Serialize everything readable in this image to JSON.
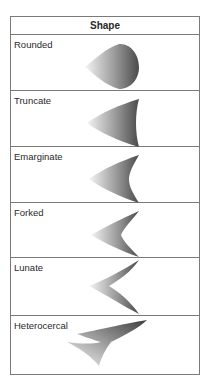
{
  "table": {
    "header": "Shape",
    "rows": [
      {
        "label": "Rounded",
        "icon": "rounded-fin"
      },
      {
        "label": "Truncate",
        "icon": "truncate-fin"
      },
      {
        "label": "Emarginate",
        "icon": "emarginate-fin"
      },
      {
        "label": "Forked",
        "icon": "forked-fin"
      },
      {
        "label": "Lunate",
        "icon": "lunate-fin"
      },
      {
        "label": "Heterocercal",
        "icon": "heterocercal-fin"
      }
    ]
  },
  "colors": {
    "border": "#7a7a7a",
    "fin_dark": "#4a4a4a",
    "fin_light": "#f2f2f2"
  }
}
